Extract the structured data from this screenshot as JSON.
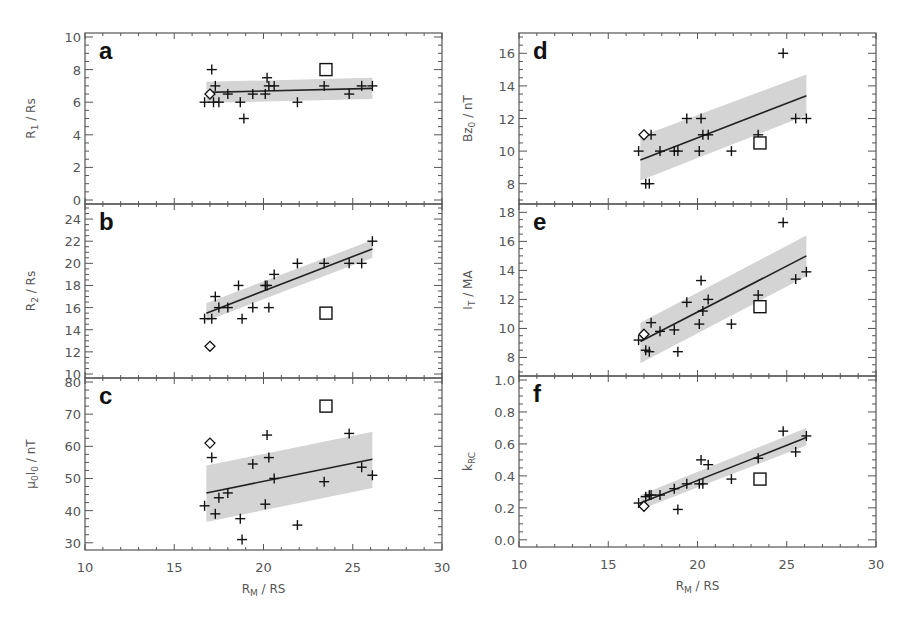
{
  "chart_data": [
    {
      "panel": "a",
      "type": "scatter",
      "xlabel": "",
      "ylabel": "R1 / Rs",
      "ylabel_main": "R",
      "ylabel_sub": "1",
      "ylabel_unit": " /  Rs",
      "xlim": [
        10,
        30
      ],
      "ylim": [
        0,
        10
      ],
      "yticks": [
        0,
        2,
        4,
        6,
        8,
        10
      ],
      "xticks": [
        10,
        15,
        20,
        25,
        30
      ],
      "show_xticklabels": false,
      "fit": {
        "x": [
          16.8,
          26.1
        ],
        "y": [
          6.6,
          6.85
        ]
      },
      "band": {
        "x": [
          16.8,
          26.1
        ],
        "y_low": [
          5.95,
          6.2
        ],
        "y_high": [
          7.25,
          7.5
        ]
      },
      "points_plus": [
        [
          16.7,
          6.0
        ],
        [
          17.1,
          8.0
        ],
        [
          17.3,
          7.0
        ],
        [
          17.2,
          6.0
        ],
        [
          17.5,
          6.0
        ],
        [
          18.0,
          6.5
        ],
        [
          18.7,
          6.0
        ],
        [
          18.9,
          5.0
        ],
        [
          19.4,
          6.5
        ],
        [
          20.1,
          6.5
        ],
        [
          20.2,
          7.5
        ],
        [
          20.3,
          7.0
        ],
        [
          20.6,
          7.0
        ],
        [
          21.9,
          6.0
        ],
        [
          23.4,
          7.0
        ],
        [
          24.8,
          6.5
        ],
        [
          25.5,
          7.0
        ],
        [
          26.1,
          7.0
        ]
      ],
      "point_diamond": [
        17.0,
        6.5
      ],
      "point_square": [
        23.5,
        8.0
      ]
    },
    {
      "panel": "b",
      "type": "scatter",
      "xlabel": "",
      "ylabel": "R2 / Rs",
      "ylabel_main": "R",
      "ylabel_sub": "2",
      "ylabel_unit": " /  Rs",
      "xlim": [
        10,
        30
      ],
      "ylim": [
        10,
        25
      ],
      "yticks": [
        10,
        12,
        14,
        16,
        18,
        20,
        22,
        24
      ],
      "xticks": [
        10,
        15,
        20,
        25,
        30
      ],
      "show_xticklabels": false,
      "fit": {
        "x": [
          16.8,
          26.1
        ],
        "y": [
          15.5,
          21.3
        ]
      },
      "band": {
        "x": [
          16.8,
          26.1
        ],
        "y_low": [
          14.8,
          20.5
        ],
        "y_high": [
          16.4,
          22.1
        ]
      },
      "points_plus": [
        [
          16.7,
          15.0
        ],
        [
          17.1,
          15.0
        ],
        [
          17.3,
          17.0
        ],
        [
          17.5,
          16.0
        ],
        [
          18.0,
          16.0
        ],
        [
          18.6,
          18.0
        ],
        [
          18.8,
          15.0
        ],
        [
          19.4,
          16.0
        ],
        [
          20.1,
          18.0
        ],
        [
          20.2,
          18.0
        ],
        [
          20.3,
          16.0
        ],
        [
          20.6,
          19.0
        ],
        [
          21.9,
          20.0
        ],
        [
          23.4,
          20.0
        ],
        [
          24.8,
          20.0
        ],
        [
          25.5,
          20.0
        ],
        [
          26.1,
          22.0
        ]
      ],
      "point_diamond": [
        17.0,
        12.5
      ],
      "point_square": [
        23.5,
        15.5
      ]
    },
    {
      "panel": "c",
      "type": "scatter",
      "xlabel": "RM / RS",
      "xlabel_main": "R",
      "xlabel_sub": "M",
      "xlabel_unit": " /  RS",
      "ylabel": "μ0I0 / nT",
      "ylabel_main": "μ",
      "ylabel_sub": "0",
      "ylabel_mid": "I",
      "ylabel_sub2": "0",
      "ylabel_unit": " /  nT",
      "xlim": [
        10,
        30
      ],
      "ylim": [
        29,
        80
      ],
      "yticks": [
        30,
        40,
        50,
        60,
        70,
        80
      ],
      "xticks": [
        10,
        15,
        20,
        25,
        30
      ],
      "show_xticklabels": true,
      "fit": {
        "x": [
          16.8,
          26.1
        ],
        "y": [
          45.5,
          56.0
        ]
      },
      "band": {
        "x": [
          16.8,
          26.1
        ],
        "y_low": [
          36.5,
          47.0
        ],
        "y_high": [
          54.0,
          64.5
        ]
      },
      "points_plus": [
        [
          16.7,
          41.5
        ],
        [
          17.1,
          56.5
        ],
        [
          17.3,
          39.0
        ],
        [
          17.5,
          44.0
        ],
        [
          18.0,
          45.5
        ],
        [
          18.7,
          37.5
        ],
        [
          18.8,
          31.0
        ],
        [
          19.4,
          54.5
        ],
        [
          20.1,
          42.0
        ],
        [
          20.2,
          63.5
        ],
        [
          20.3,
          56.5
        ],
        [
          20.6,
          50.0
        ],
        [
          21.9,
          35.5
        ],
        [
          23.4,
          49.0
        ],
        [
          24.8,
          64.0
        ],
        [
          25.5,
          53.5
        ],
        [
          26.1,
          51.0
        ]
      ],
      "point_diamond": [
        17.0,
        61.0
      ],
      "point_square": [
        23.5,
        72.5
      ]
    },
    {
      "panel": "d",
      "type": "scatter",
      "xlabel": "",
      "ylabel": "Bz0 / nT",
      "ylabel_main": "Bz",
      "ylabel_sub": "0",
      "ylabel_unit": " /  nT",
      "xlim": [
        10,
        30
      ],
      "ylim": [
        7,
        17
      ],
      "yticks": [
        8,
        10,
        12,
        14,
        16
      ],
      "xticks": [
        10,
        15,
        20,
        25,
        30
      ],
      "show_xticklabels": false,
      "fit": {
        "x": [
          16.8,
          26.1
        ],
        "y": [
          9.45,
          13.4
        ]
      },
      "band": {
        "x": [
          16.8,
          26.1
        ],
        "y_low": [
          8.2,
          12.2
        ],
        "y_high": [
          10.9,
          14.7
        ]
      },
      "points_plus": [
        [
          16.7,
          10.0
        ],
        [
          17.1,
          8.0
        ],
        [
          17.3,
          8.0
        ],
        [
          17.4,
          11.0
        ],
        [
          17.9,
          10.0
        ],
        [
          18.7,
          10.0
        ],
        [
          18.9,
          10.0
        ],
        [
          19.4,
          12.0
        ],
        [
          20.1,
          10.0
        ],
        [
          20.2,
          12.0
        ],
        [
          20.3,
          11.0
        ],
        [
          20.6,
          11.0
        ],
        [
          21.9,
          10.0
        ],
        [
          23.4,
          11.0
        ],
        [
          24.8,
          16.0
        ],
        [
          25.5,
          12.0
        ],
        [
          26.1,
          12.0
        ]
      ],
      "point_diamond": [
        17.0,
        11.0
      ],
      "point_square": [
        23.5,
        10.5
      ]
    },
    {
      "panel": "e",
      "type": "scatter",
      "xlabel": "",
      "ylabel": "IT / MA",
      "ylabel_main": "I",
      "ylabel_sub": "T",
      "ylabel_unit": " /  MA",
      "xlim": [
        10,
        30
      ],
      "ylim": [
        7,
        18.3
      ],
      "yticks": [
        8,
        10,
        12,
        14,
        16,
        18
      ],
      "xticks": [
        10,
        15,
        20,
        25,
        30
      ],
      "show_xticklabels": false,
      "fit": {
        "x": [
          16.8,
          26.1
        ],
        "y": [
          9.1,
          15.0
        ]
      },
      "band": {
        "x": [
          16.8,
          26.1
        ],
        "y_low": [
          7.6,
          13.6
        ],
        "y_high": [
          10.4,
          16.4
        ]
      },
      "points_plus": [
        [
          16.7,
          9.2
        ],
        [
          17.1,
          8.5
        ],
        [
          17.3,
          8.4
        ],
        [
          17.4,
          10.4
        ],
        [
          17.9,
          9.8
        ],
        [
          18.7,
          9.9
        ],
        [
          18.9,
          8.4
        ],
        [
          19.4,
          11.8
        ],
        [
          20.1,
          10.3
        ],
        [
          20.2,
          13.3
        ],
        [
          20.3,
          11.2
        ],
        [
          20.6,
          12.0
        ],
        [
          21.9,
          10.3
        ],
        [
          23.4,
          12.3
        ],
        [
          24.8,
          17.3
        ],
        [
          25.5,
          13.4
        ],
        [
          26.1,
          13.9
        ]
      ],
      "point_diamond": [
        17.0,
        9.6
      ],
      "point_square": [
        23.5,
        11.5
      ]
    },
    {
      "panel": "f",
      "type": "scatter",
      "xlabel": "RM / RS",
      "xlabel_main": "R",
      "xlabel_sub": "M",
      "xlabel_unit": " /  RS",
      "ylabel": "kRC",
      "ylabel_main": "k",
      "ylabel_sub": "RC",
      "ylabel_unit": "",
      "xlim": [
        10,
        30
      ],
      "ylim": [
        -0.02,
        1.0
      ],
      "yticks": [
        0.0,
        0.2,
        0.4,
        0.6,
        0.8,
        1.0
      ],
      "ytick_format": "1dp",
      "xticks": [
        10,
        15,
        20,
        25,
        30
      ],
      "show_xticklabels": true,
      "fit": {
        "x": [
          16.8,
          26.1
        ],
        "y": [
          0.23,
          0.64
        ]
      },
      "band": {
        "x": [
          16.8,
          26.1
        ],
        "y_low": [
          0.19,
          0.59
        ],
        "y_high": [
          0.28,
          0.7
        ]
      },
      "points_plus": [
        [
          16.7,
          0.23
        ],
        [
          17.1,
          0.27
        ],
        [
          17.3,
          0.28
        ],
        [
          17.4,
          0.28
        ],
        [
          17.9,
          0.28
        ],
        [
          18.7,
          0.32
        ],
        [
          18.9,
          0.19
        ],
        [
          19.4,
          0.35
        ],
        [
          20.1,
          0.35
        ],
        [
          20.2,
          0.5
        ],
        [
          20.3,
          0.35
        ],
        [
          20.6,
          0.47
        ],
        [
          21.9,
          0.38
        ],
        [
          23.4,
          0.51
        ],
        [
          24.8,
          0.68
        ],
        [
          25.5,
          0.55
        ],
        [
          26.1,
          0.65
        ]
      ],
      "point_diamond": [
        17.0,
        0.21
      ],
      "point_square": [
        23.5,
        0.38
      ]
    }
  ],
  "colors": {
    "axis": "#555555",
    "marker": "#111111",
    "fit_line": "#222222",
    "band": "#d4d4d4",
    "text": "#555555",
    "letter": "#111111"
  }
}
